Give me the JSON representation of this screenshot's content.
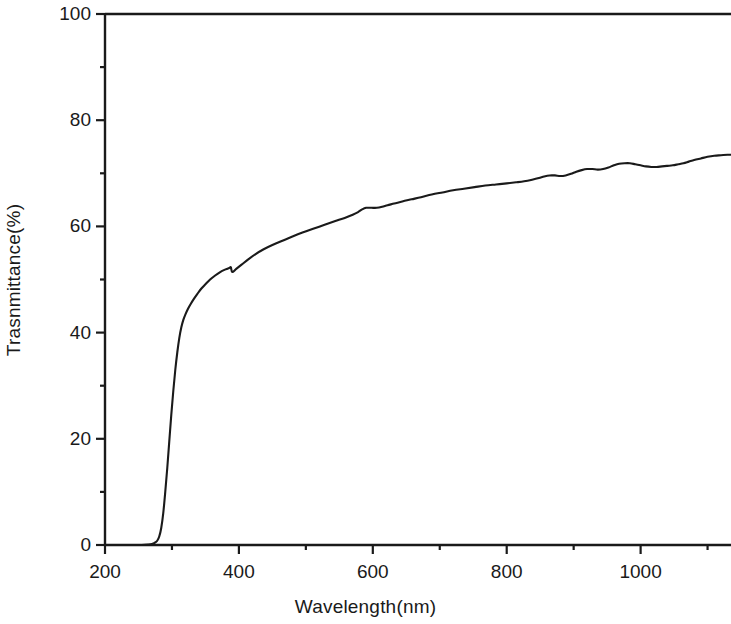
{
  "figure": {
    "background_color": "#ffffff",
    "line_color": "#1a1a1a",
    "axis_color": "#1a1a1a"
  },
  "chart_data": {
    "type": "line",
    "title": "",
    "subtitle": "",
    "xlabel": "Wavelength(nm)",
    "ylabel": "Trasnmittance(%)",
    "xlim": [
      200,
      1135
    ],
    "ylim": [
      0,
      100
    ],
    "grid": false,
    "legend": null,
    "x_major_ticks": [
      200,
      400,
      600,
      800,
      1000
    ],
    "x_minor_ticks": [
      300,
      500,
      700,
      900,
      1100
    ],
    "x_tick_labels": [
      "200",
      "400",
      "600",
      "800",
      "1000"
    ],
    "y_major_ticks": [
      0,
      20,
      40,
      60,
      80,
      100
    ],
    "y_minor_ticks": [
      10,
      30,
      50,
      70,
      90
    ],
    "y_tick_labels": [
      "0",
      "20",
      "40",
      "60",
      "80",
      "100"
    ],
    "series": [
      {
        "name": "Transmittance",
        "color": "#1a1a1a",
        "x": [
          200,
          220,
          240,
          255,
          265,
          270,
          274,
          278,
          281,
          284,
          287,
          290,
          293,
          296,
          299,
          302,
          305,
          308,
          311,
          314,
          317,
          320,
          324,
          328,
          333,
          338,
          344,
          350,
          357,
          364,
          372,
          380,
          386,
          388,
          390,
          396,
          404,
          414,
          425,
          437,
          450,
          465,
          480,
          496,
          512,
          528,
          544,
          558,
          570,
          578,
          584,
          590,
          598,
          606,
          614,
          622,
          632,
          644,
          658,
          672,
          688,
          704,
          720,
          736,
          752,
          768,
          784,
          800,
          814,
          826,
          838,
          848,
          856,
          864,
          872,
          880,
          888,
          896,
          904,
          912,
          920,
          928,
          936,
          944,
          952,
          960,
          968,
          976,
          984,
          992,
          1000,
          1008,
          1016,
          1024,
          1032,
          1040,
          1048,
          1056,
          1064,
          1072,
          1080,
          1090,
          1100,
          1110,
          1120,
          1130,
          1135
        ],
        "y": [
          0.0,
          0.0,
          0.0,
          0.0,
          0.1,
          0.2,
          0.4,
          0.8,
          1.6,
          3.2,
          6.0,
          10.0,
          14.5,
          19.5,
          24.5,
          29.0,
          33.0,
          36.3,
          39.0,
          41.0,
          42.4,
          43.4,
          44.5,
          45.4,
          46.4,
          47.3,
          48.3,
          49.1,
          50.0,
          50.7,
          51.4,
          51.9,
          52.2,
          52.3,
          51.4,
          52.0,
          52.8,
          53.8,
          54.8,
          55.7,
          56.5,
          57.3,
          58.1,
          58.9,
          59.6,
          60.3,
          61.0,
          61.6,
          62.2,
          62.7,
          63.2,
          63.5,
          63.5,
          63.5,
          63.7,
          64.0,
          64.3,
          64.7,
          65.1,
          65.5,
          66.0,
          66.4,
          66.8,
          67.1,
          67.4,
          67.7,
          67.9,
          68.1,
          68.3,
          68.5,
          68.8,
          69.1,
          69.4,
          69.6,
          69.6,
          69.5,
          69.6,
          69.9,
          70.3,
          70.6,
          70.8,
          70.8,
          70.7,
          70.8,
          71.1,
          71.5,
          71.8,
          71.9,
          71.9,
          71.7,
          71.5,
          71.3,
          71.2,
          71.2,
          71.3,
          71.4,
          71.5,
          71.7,
          71.9,
          72.2,
          72.5,
          72.8,
          73.1,
          73.3,
          73.4,
          73.5,
          73.5
        ],
        "notes": "Sharp UV absorption edge near 285-320 nm; small step artifact near 388 nm; plateau near 590-610 nm; interference ripples above 900 nm"
      }
    ]
  }
}
